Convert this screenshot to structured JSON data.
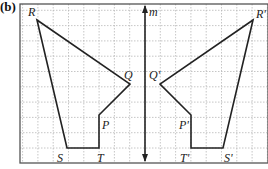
{
  "figure": {
    "part_label": "(b)",
    "axis_label": "m",
    "grid": {
      "frame": {
        "x0": 20,
        "y0": 4,
        "x1": 268,
        "y1": 163
      },
      "spacing": 15.3,
      "line_color": "#b8b8b8",
      "frame_color": "#555555"
    },
    "mirror_line": {
      "name": "m",
      "x": 145,
      "y_top": 4,
      "y_bottom": 163,
      "color": "#222222"
    },
    "original_shape": {
      "vertices": [
        {
          "name": "R",
          "x": 37,
          "y": 20,
          "label_x": 28,
          "label_y": 16
        },
        {
          "name": "Q",
          "x": 130,
          "y": 84,
          "label_x": 124,
          "label_y": 79
        },
        {
          "name": "P",
          "x": 99,
          "y": 115,
          "label_x": 102,
          "label_y": 129
        },
        {
          "name": "T",
          "x": 99,
          "y": 148,
          "label_x": 97,
          "label_y": 162
        },
        {
          "name": "S",
          "x": 67,
          "y": 148,
          "label_x": 57,
          "label_y": 162
        }
      ]
    },
    "image_shape": {
      "vertices": [
        {
          "name": "R'",
          "x": 253,
          "y": 20,
          "label_x": 256,
          "label_y": 18
        },
        {
          "name": "Q'",
          "x": 160,
          "y": 84,
          "label_x": 149,
          "label_y": 79
        },
        {
          "name": "P'",
          "x": 191,
          "y": 115,
          "label_x": 179,
          "label_y": 129
        },
        {
          "name": "T'",
          "x": 191,
          "y": 148,
          "label_x": 180,
          "label_y": 162
        },
        {
          "name": "S'",
          "x": 223,
          "y": 148,
          "label_x": 224,
          "label_y": 162
        }
      ]
    },
    "line_color": "#222222"
  }
}
